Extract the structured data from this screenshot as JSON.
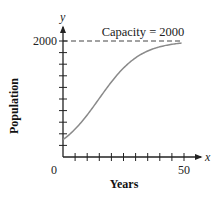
{
  "chart_data": {
    "type": "line",
    "title": "",
    "xlabel": "Years",
    "ylabel": "Population",
    "x_axis_var": "x",
    "y_axis_var": "y",
    "xlim": [
      0,
      50
    ],
    "ylim": [
      0,
      2000
    ],
    "x_tick_labels": [
      "0",
      "50"
    ],
    "y_tick_labels": [
      "2000"
    ],
    "x_tick_step": 5,
    "y_tick_step": 200,
    "grid": false,
    "annotations": [
      {
        "text": "Capacity = 2000",
        "type": "dashed-horizontal-line",
        "y": 2000
      }
    ],
    "series": [
      {
        "name": "Population (logistic growth)",
        "x": [
          0,
          5,
          10,
          15,
          20,
          25,
          30,
          35,
          40,
          45,
          50
        ],
        "values": [
          300,
          481,
          725,
          1010,
          1294,
          1534,
          1709,
          1827,
          1900,
          1943,
          1968
        ]
      }
    ]
  },
  "labels": {
    "x_var": "x",
    "y_var": "y",
    "origin": "0",
    "x_max": "50",
    "y_max": "2000",
    "xlabel": "Years",
    "ylabel": "Population",
    "capacity": "Capacity = 2000"
  },
  "colors": {
    "curve": "#8a8a8a",
    "axis": "#222222"
  }
}
